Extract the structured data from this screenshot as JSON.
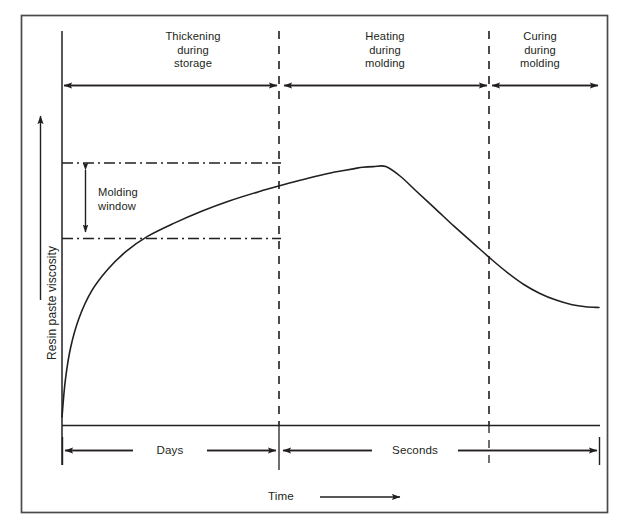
{
  "figure": {
    "border_color": "#3a3a3a",
    "line_color": "#231f20",
    "background": "#ffffff"
  },
  "axes": {
    "y_label": "Resin paste viscosity",
    "y_arrow_icon": "up-arrow-icon",
    "x_label": "Time",
    "x_arrow_icon": "right-arrow-icon"
  },
  "annotations": {
    "molding_window": "Molding\nwindow",
    "molding_window_line1": "Molding",
    "molding_window_line2": "window"
  },
  "phases": [
    {
      "id": "thickening",
      "label_line1": "Thickening",
      "label_line2": "during",
      "label_line3": "storage"
    },
    {
      "id": "heating",
      "label_line1": "Heating",
      "label_line2": "during",
      "label_line3": "molding"
    },
    {
      "id": "curing",
      "label_line1": "Curing",
      "label_line2": "during",
      "label_line3": "molding"
    }
  ],
  "time_scales": [
    {
      "id": "days",
      "label": "Days"
    },
    {
      "id": "seconds",
      "label": "Seconds"
    }
  ],
  "chart_data": {
    "type": "line",
    "xlabel": "Time",
    "ylabel": "Resin paste viscosity",
    "grid": false,
    "legend": null,
    "axis_ticks": {
      "x": [],
      "y": []
    },
    "xlim": [
      0,
      100
    ],
    "ylim": [
      0,
      100
    ],
    "series": [
      {
        "name": "Resin paste viscosity",
        "comment": "Normalized 0-100 in both axes; rises sharply during storage thickening, peaks at end of storage, falls during heating, minimum at onset of cure, then rises vertically during curing.",
        "points": [
          [
            0.0,
            1.2
          ],
          [
            0.6,
            12.0
          ],
          [
            1.6,
            22.0
          ],
          [
            3.2,
            31.0
          ],
          [
            5.5,
            39.0
          ],
          [
            8.5,
            45.5
          ],
          [
            12.0,
            51.0
          ],
          [
            16.0,
            55.5
          ],
          [
            21.0,
            59.5
          ],
          [
            26.0,
            63.0
          ],
          [
            31.0,
            66.0
          ],
          [
            36.5,
            68.8
          ],
          [
            42.0,
            71.3
          ],
          [
            46.0,
            73.0
          ],
          [
            50.0,
            74.5
          ],
          [
            52.5,
            75.2
          ],
          [
            54.5,
            75.8
          ],
          [
            56.0,
            76.2
          ],
          [
            58.0,
            76.4
          ],
          [
            60.3,
            76.4
          ],
          [
            63.0,
            73.5
          ],
          [
            66.0,
            69.0
          ],
          [
            69.5,
            63.8
          ],
          [
            73.0,
            58.5
          ],
          [
            76.5,
            53.5
          ],
          [
            80.0,
            48.5
          ],
          [
            83.0,
            44.5
          ],
          [
            86.0,
            41.0
          ],
          [
            89.0,
            38.3
          ],
          [
            92.0,
            36.3
          ],
          [
            95.0,
            34.9
          ],
          [
            97.5,
            34.3
          ],
          [
            100.0,
            34.1
          ]
        ]
      }
    ],
    "markers": {
      "vertical_dashed_lines": [
        {
          "id": "end-of-storage",
          "x": 60.3,
          "style": "dashed"
        },
        {
          "id": "onset-of-cure",
          "x": 100.0,
          "style": "dashed"
        }
      ],
      "horizontal_dashdot_lines": [
        {
          "id": "molding-window-upper",
          "y": 67.0,
          "style": "dash-dot"
        },
        {
          "id": "molding-window-lower",
          "y": 47.8,
          "style": "dash-dot"
        }
      ]
    }
  },
  "caption": {
    "text": ""
  }
}
